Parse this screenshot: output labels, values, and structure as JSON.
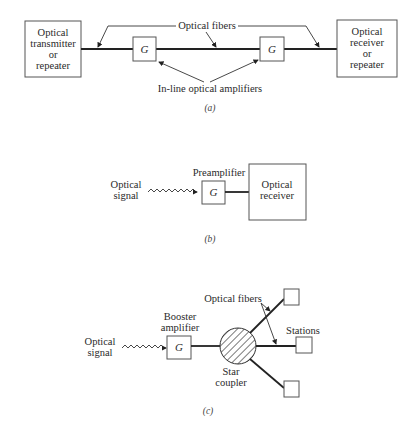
{
  "panel_a": {
    "transmitter": [
      "Optical",
      "transmitter",
      "or",
      "repeater"
    ],
    "receiver": [
      "Optical",
      "receiver",
      "or",
      "repeater"
    ],
    "amp_symbol": "G",
    "fibers_label": "Optical fibers",
    "amplifiers_label": "In-line optical amplifiers",
    "caption": "(a)"
  },
  "panel_b": {
    "signal": [
      "Optical",
      "signal"
    ],
    "amp_label": "Preamplifier",
    "amp_symbol": "G",
    "receiver": [
      "Optical",
      "receiver"
    ],
    "caption": "(b)"
  },
  "panel_c": {
    "signal": [
      "Optical",
      "signal"
    ],
    "amp_label": [
      "Booster",
      "amplifier"
    ],
    "amp_symbol": "G",
    "coupler_label": [
      "Star",
      "coupler"
    ],
    "fibers_label": "Optical fibers",
    "stations_label": "Stations",
    "caption": "(c)"
  }
}
